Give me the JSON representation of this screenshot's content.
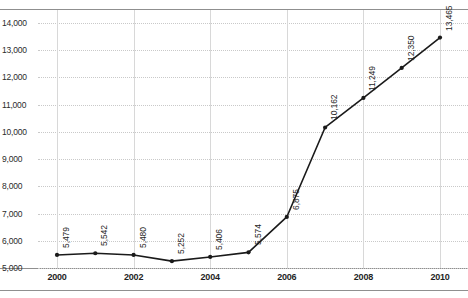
{
  "chart_data": {
    "type": "line",
    "title": "",
    "xlabel": "",
    "ylabel": "",
    "x": [
      2000,
      2001,
      2002,
      2003,
      2004,
      2005,
      2006,
      2007,
      2008,
      2009,
      2010
    ],
    "values": [
      5479,
      5542,
      5480,
      5252,
      5406,
      5574,
      6875,
      10162,
      11249,
      12350,
      13465
    ],
    "point_labels": [
      "5,479",
      "5,542",
      "5,480",
      "5,252",
      "5,406",
      "5,574",
      "6,875",
      "10,162",
      "11,249",
      "12,350",
      "13,465"
    ],
    "ylim": [
      5000,
      14000
    ],
    "ytick_values": [
      14000,
      13000,
      12000,
      11000,
      10000,
      9000,
      8000,
      7000,
      6000,
      5000
    ],
    "ytick_labels": [
      "14,000",
      "13,000",
      "12,000",
      "11,000",
      "10,000",
      "9,000",
      "8,000",
      "7,000",
      "6,000",
      "5,000"
    ],
    "xtick_values": [
      2000,
      2002,
      2004,
      2006,
      2008,
      2010
    ],
    "xtick_labels": [
      "2000",
      "2002",
      "2004",
      "2006",
      "2008",
      "2010"
    ],
    "xlim": [
      2000,
      2010
    ],
    "grid": "both",
    "legend": "none",
    "series_color": "#1a1a1a",
    "gridline_color": "#c9c9c9",
    "marker": "circle",
    "data_labels": true,
    "data_label_rotation": -90
  },
  "axes": {
    "ytick_labels": [
      "14,000",
      "13,000",
      "12,000",
      "11,000",
      "10,000",
      "9,000",
      "8,000",
      "7,000",
      "6,000",
      "5,000"
    ],
    "xtick_labels": [
      "2000",
      "2002",
      "2004",
      "2006",
      "2008",
      "2010"
    ]
  }
}
